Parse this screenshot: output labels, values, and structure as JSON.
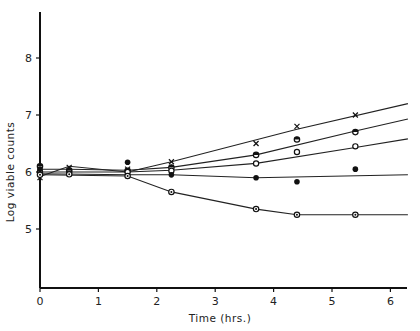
{
  "chart_data": {
    "type": "line",
    "title": "",
    "xlabel": "Time (hrs.)",
    "ylabel": "Log viable counts",
    "xlim": [
      0,
      6.3
    ],
    "ylim": [
      4.0,
      8.85
    ],
    "xticks": [
      "0",
      "1",
      "2",
      "3",
      "4",
      "5",
      "6"
    ],
    "yticks": [
      "5",
      "6",
      "7",
      "8"
    ],
    "grid": false,
    "legend": "none",
    "series": [
      {
        "name": "cross (x)",
        "marker": "x",
        "points": [
          [
            0,
            5.9
          ],
          [
            0.5,
            6.08
          ],
          [
            1.5,
            6.05
          ],
          [
            2.25,
            6.18
          ],
          [
            3.7,
            6.5
          ],
          [
            4.4,
            6.8
          ],
          [
            5.4,
            7.0
          ]
        ],
        "line": [
          [
            0,
            5.92
          ],
          [
            0.5,
            6.1
          ],
          [
            1.5,
            6.0
          ],
          [
            2.25,
            6.18
          ],
          [
            4.4,
            6.75
          ],
          [
            6.3,
            7.2
          ]
        ]
      },
      {
        "name": "half-filled circle",
        "marker": "half",
        "points": [
          [
            0,
            6.1
          ],
          [
            0.5,
            6.03
          ],
          [
            1.5,
            6.02
          ],
          [
            2.25,
            6.08
          ],
          [
            3.7,
            6.3
          ],
          [
            4.4,
            6.57
          ],
          [
            5.4,
            6.7
          ]
        ],
        "line": [
          [
            0,
            6.05
          ],
          [
            0.5,
            6.05
          ],
          [
            1.5,
            6.03
          ],
          [
            2.25,
            6.08
          ],
          [
            3.7,
            6.3
          ],
          [
            5.4,
            6.72
          ],
          [
            6.3,
            6.93
          ]
        ]
      },
      {
        "name": "open circle",
        "marker": "open",
        "points": [
          [
            0,
            6.0
          ],
          [
            0.5,
            6.0
          ],
          [
            1.5,
            6.0
          ],
          [
            2.25,
            6.02
          ],
          [
            3.7,
            6.15
          ],
          [
            4.4,
            6.35
          ],
          [
            5.4,
            6.45
          ]
        ],
        "line": [
          [
            0,
            6.0
          ],
          [
            1.5,
            6.0
          ],
          [
            2.25,
            6.03
          ],
          [
            3.7,
            6.15
          ],
          [
            5.4,
            6.43
          ],
          [
            6.3,
            6.58
          ]
        ]
      },
      {
        "name": "filled circle",
        "marker": "filled",
        "points": [
          [
            0,
            6.05
          ],
          [
            0.5,
            5.98
          ],
          [
            1.5,
            6.17
          ],
          [
            2.25,
            5.95
          ],
          [
            3.7,
            5.9
          ],
          [
            4.4,
            5.83
          ],
          [
            5.4,
            6.05
          ]
        ],
        "line": [
          [
            0,
            5.97
          ],
          [
            1.5,
            5.95
          ],
          [
            2.25,
            5.95
          ],
          [
            3.7,
            5.9
          ],
          [
            6.3,
            5.95
          ]
        ]
      },
      {
        "name": "dotted circle (declining)",
        "marker": "dot",
        "points": [
          [
            0,
            5.95
          ],
          [
            0.5,
            5.96
          ],
          [
            1.5,
            5.93
          ],
          [
            2.25,
            5.65
          ],
          [
            3.7,
            5.35
          ],
          [
            4.4,
            5.25
          ],
          [
            5.4,
            5.25
          ]
        ],
        "line": [
          [
            0,
            5.95
          ],
          [
            1.5,
            5.93
          ],
          [
            2.25,
            5.65
          ],
          [
            3.7,
            5.35
          ],
          [
            4.4,
            5.25
          ],
          [
            6.3,
            5.25
          ]
        ]
      }
    ]
  }
}
